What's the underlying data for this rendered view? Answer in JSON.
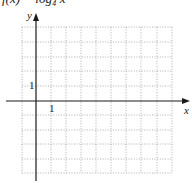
{
  "title": "f(x) = log₄ x",
  "graph": {
    "x_axis_label": "x",
    "y_axis_label": "y",
    "x_tick_label": "1",
    "y_tick_label": "1",
    "x_range": [
      -1,
      9
    ],
    "y_range": [
      -5,
      5
    ],
    "grid": "dotted",
    "grid_color": "#9a9a9a",
    "axis_color": "#1a1a1a"
  }
}
